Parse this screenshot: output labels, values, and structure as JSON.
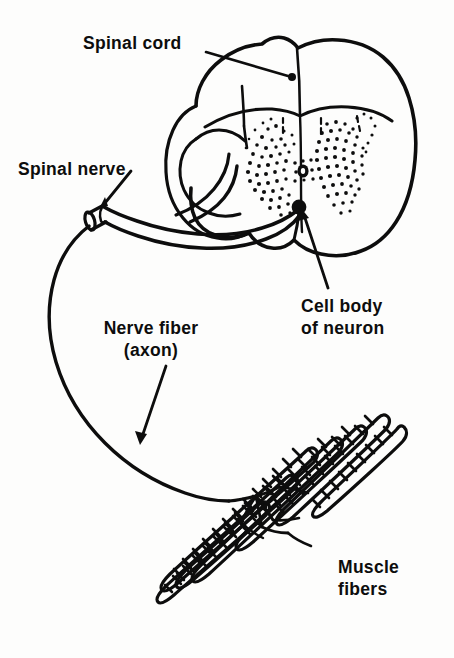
{
  "figure": {
    "background_color": "#fdfdfc",
    "ink_color": "#0d0d0d",
    "width": 454,
    "height": 658
  },
  "labels": {
    "spinal_cord": {
      "text": "Spinal cord",
      "lines": [
        "Spinal cord"
      ],
      "leader": "line-with-dot",
      "points_to": "spinal-cord-white-matter"
    },
    "spinal_nerve": {
      "text": "Spinal nerve",
      "lines": [
        "Spinal nerve"
      ],
      "leader": "short-arrow",
      "points_to": "cut-nerve-end"
    },
    "nerve_fiber": {
      "text": "Nerve fiber (axon)",
      "lines": [
        "Nerve fiber",
        "(axon)"
      ],
      "leader": "arrow",
      "points_to": "axon-curve"
    },
    "cell_body": {
      "text": "Cell body of neuron",
      "lines": [
        "Cell body",
        "of neuron"
      ],
      "leader": "arrow",
      "points_to": "neuron-soma-dot"
    },
    "muscle_fibers": {
      "text": "Muscle fibers",
      "lines": [
        "Muscle",
        "fibers"
      ],
      "leader": "none",
      "points_to": "striated-fiber-bundle"
    }
  },
  "structures": [
    {
      "name": "spinal-cord-cross-section",
      "kind": "outline",
      "description": "Oval transverse section of spinal cord with anterior median fissure and posterior median sulcus"
    },
    {
      "name": "gray-matter",
      "kind": "stipple",
      "description": "Butterfly shaped stippled gray matter with dorsal and ventral horns"
    },
    {
      "name": "central-canal",
      "kind": "ring",
      "description": "Small black ring at the center of the gray matter"
    },
    {
      "name": "neuron-soma-dot",
      "kind": "filled-dot",
      "description": "Black dot marking the motor neuron cell body in the ventral horn"
    },
    {
      "name": "spinal-nerve-root",
      "kind": "double-line",
      "description": "Nerve root leaving the ventral horn and running to the cut spinal nerve"
    },
    {
      "name": "cut-nerve-end",
      "kind": "cylinder",
      "description": "Cut open end of the spinal nerve drawn as a short tube"
    },
    {
      "name": "axon",
      "kind": "long-curve",
      "description": "Single long nerve fiber looping down and to the right toward the muscle"
    },
    {
      "name": "motor-end-plates",
      "kind": "branching",
      "description": "Axon terminal branches spreading onto the muscle fibers"
    },
    {
      "name": "striated-fiber-bundle",
      "kind": "hatched-cylinders",
      "description": "Seven elongated cross striated skeletal muscle fibers running diagonally"
    }
  ]
}
